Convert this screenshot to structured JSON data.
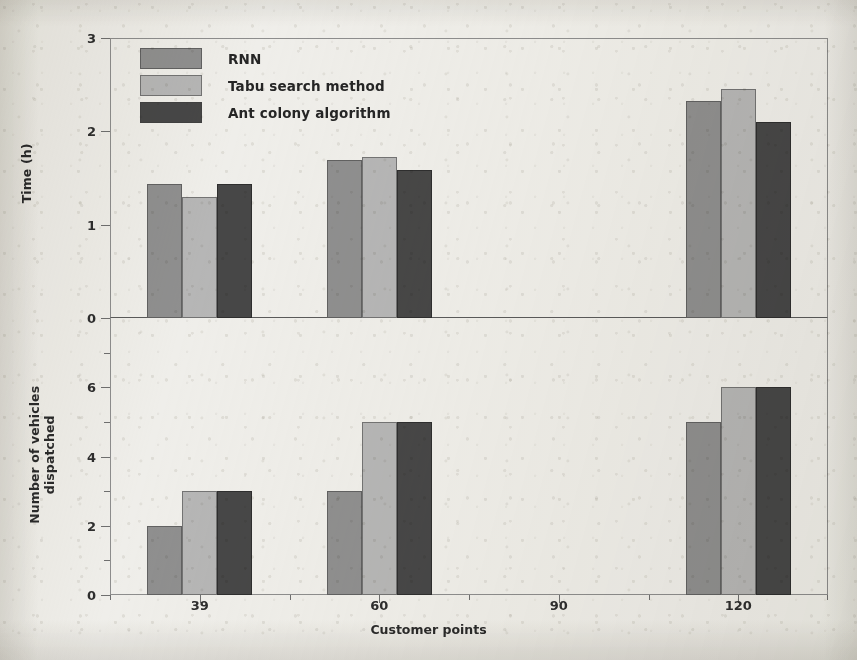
{
  "chart_data": {
    "type": "bar",
    "title": "",
    "xlabel": "Customer points",
    "categories": [
      "39",
      "60",
      "90",
      "120"
    ],
    "grid": false,
    "legend_position": "top-left inside upper panel",
    "panels": [
      {
        "name": "time",
        "ylabel": "Time (h)",
        "ylim": [
          0,
          3
        ],
        "yticks": [
          0,
          1,
          2,
          3
        ],
        "ytick_labels": [
          "0",
          "1",
          "2",
          "3"
        ],
        "yminor_ticks": [],
        "series": [
          {
            "name": "RNN",
            "color": "#8f8f8f",
            "values": [
              1.44,
              1.69,
              null,
              2.32
            ]
          },
          {
            "name": "Tabu search method",
            "color": "#b6b6b6",
            "values": [
              1.3,
              1.73,
              null,
              2.45
            ]
          },
          {
            "name": "Ant colony algorithm",
            "color": "#474747",
            "values": [
              1.44,
              1.59,
              null,
              2.1
            ]
          }
        ]
      },
      {
        "name": "vehicles",
        "ylabel": "Number of vehicles\ndispatched",
        "ylim": [
          0,
          8
        ],
        "yticks": [
          0,
          2,
          4,
          6
        ],
        "ytick_labels": [
          "0",
          "2",
          "4",
          "6"
        ],
        "yminor_ticks": [
          1,
          3,
          5,
          7,
          8
        ],
        "series": [
          {
            "name": "RNN",
            "color": "#8f8f8f",
            "values": [
              2,
              3,
              null,
              5
            ]
          },
          {
            "name": "Tabu search method",
            "color": "#b6b6b6",
            "values": [
              3,
              5,
              null,
              6
            ]
          },
          {
            "name": "Ant colony algorithm",
            "color": "#474747",
            "values": [
              3,
              5,
              null,
              6
            ]
          }
        ]
      }
    ]
  },
  "legend": {
    "items": [
      {
        "label": "RNN",
        "color": "#8f8f8f"
      },
      {
        "label": "Tabu search method",
        "color": "#b6b6b6"
      },
      {
        "label": "Ant colony algorithm",
        "color": "#474747"
      }
    ]
  }
}
